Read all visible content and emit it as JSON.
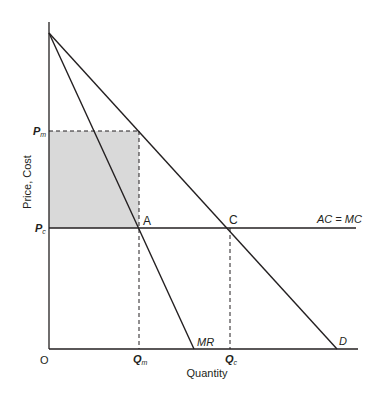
{
  "diagram": {
    "type": "monopoly-deadweight-diagram",
    "axes": {
      "ylabel": "Price, Cost",
      "xlabel": "Quantity",
      "origin": "O"
    },
    "price_labels": {
      "pm_main": "P",
      "pm_sub": "m",
      "pc_main": "P",
      "pc_sub": "c"
    },
    "quantity_labels": {
      "qm_main": "Q",
      "qm_sub": "m",
      "qc_main": "Q",
      "qc_sub": "c"
    },
    "curves": {
      "demand": "D",
      "marginal_revenue": "MR",
      "cost": "AC = MC"
    },
    "points": {
      "a": "A",
      "c": "C"
    },
    "colors": {
      "line": "#231f20",
      "shaded_area": "#d9d9d9",
      "background": "#ffffff"
    }
  }
}
